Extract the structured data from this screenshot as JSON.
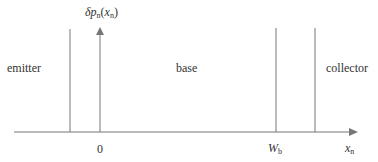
{
  "diagram": {
    "y_axis_label": {
      "main": "δp",
      "sub": "n",
      "open": "(",
      "var": "x",
      "var_sub": "n",
      "close": ")"
    },
    "x_axis_label": {
      "main": "x",
      "sub": "n"
    },
    "regions": {
      "emitter": "emitter",
      "base": "base",
      "collector": "collector"
    },
    "ticks": {
      "origin": "0",
      "wb_main": "W",
      "wb_sub": "b"
    },
    "colors": {
      "line": "#777777",
      "text": "#333333"
    }
  }
}
